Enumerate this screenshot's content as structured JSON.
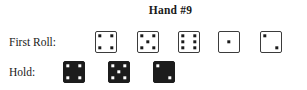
{
  "title": "Hand #9",
  "rows": {
    "first_roll": {
      "label": "First Roll:",
      "style": "light",
      "dice": [
        {
          "value": 4,
          "x": 0
        },
        {
          "value": 5,
          "x": 42
        },
        {
          "value": 6,
          "x": 83
        },
        {
          "value": 1,
          "x": 123
        },
        {
          "value": 2,
          "x": 165
        }
      ]
    },
    "hold": {
      "label": "Hold:",
      "style": "dark",
      "dice": [
        {
          "value": 4,
          "x": 0
        },
        {
          "value": 5,
          "x": 45
        },
        {
          "value": 2,
          "x": 90
        }
      ]
    }
  },
  "colors": {
    "background": "#ffffff",
    "ink": "#1a1a1a",
    "die_light_face": "#ffffff",
    "die_light_border": "#3b3b3b",
    "die_dark_face": "#1c1c1c",
    "pip_light": "#1a1a1a",
    "pip_dark": "#ffffff"
  }
}
